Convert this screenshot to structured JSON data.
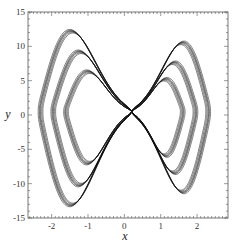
{
  "chart_data": {
    "type": "line",
    "title": "",
    "xlabel": "x",
    "ylabel": "y",
    "xlim": [
      -2.65,
      2.85
    ],
    "ylim": [
      -15,
      15
    ],
    "xticks": [
      -2,
      -1,
      0,
      1,
      2
    ],
    "xtick_labels": [
      "-2",
      "-1",
      "0",
      "1",
      "2"
    ],
    "yticks": [
      -15,
      -10,
      -5,
      0,
      5,
      10,
      15
    ],
    "ytick_labels": [
      "-15",
      "-10",
      "-5",
      "0",
      "5",
      "10",
      "15"
    ],
    "grid": false,
    "legend": null,
    "series": [
      {
        "name": "outer orbit",
        "color": "#111111",
        "left_lobe": {
          "x_min": -2.3,
          "peak": [
            -1.5,
            12.2
          ],
          "trough": [
            -1.5,
            -13.1
          ]
        },
        "right_lobe": {
          "x_max": 2.3,
          "peak": [
            1.6,
            10.5
          ],
          "trough": [
            1.6,
            -11.2
          ]
        }
      },
      {
        "name": "middle orbit",
        "color": "#111111",
        "left_lobe": {
          "x_min": -1.95,
          "peak": [
            -1.45,
            9.2
          ],
          "trough": [
            -1.4,
            -10.2
          ]
        },
        "right_lobe": {
          "x_max": 1.95,
          "peak": [
            1.55,
            7.6
          ],
          "trough": [
            1.5,
            -8.4
          ]
        }
      },
      {
        "name": "inner orbit",
        "color": "#111111",
        "left_lobe": {
          "x_min": -1.6,
          "peak": [
            -1.4,
            6.3
          ],
          "trough": [
            -1.35,
            -7.0
          ]
        },
        "right_lobe": {
          "x_max": 1.6,
          "peak": [
            1.5,
            5.2
          ],
          "trough": [
            1.45,
            -5.9
          ]
        }
      }
    ]
  }
}
